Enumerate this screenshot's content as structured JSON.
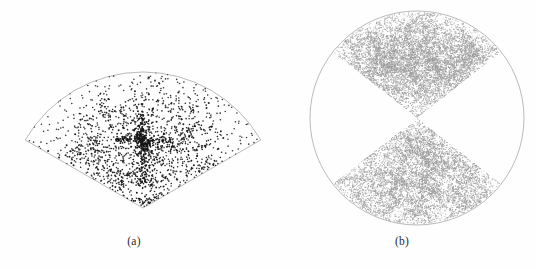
{
  "figure": {
    "background_color": "#fefefe",
    "width": 536,
    "height": 269
  },
  "panels": [
    {
      "id": "a",
      "caption": "(a)",
      "name": "wedge-slice-scatter"
    },
    {
      "id": "b",
      "caption": "(b)",
      "name": "circular-bowtie-scatter"
    }
  ],
  "chart_data": [
    {
      "type": "scatter",
      "panel": "a",
      "title": "(a)",
      "xlabel": "",
      "ylabel": "",
      "geometry": "annular-wedge",
      "grid": false,
      "legend": null,
      "point_color": "#161616",
      "outline_color": "#8d8d8d",
      "point_size_px": 1.6,
      "n_points": 1100,
      "apex": [
        143,
        208
      ],
      "radius": 136,
      "half_angle_deg": 60,
      "description": "Sparse wedge-shaped redshift survey slice with filamentary 'stick-man' structure radiating from the apex; dark discrete points on white.",
      "clusters": [
        {
          "cx": 143,
          "cy": 140,
          "spread": 7,
          "n": 150,
          "label": "central-core"
        },
        {
          "cx": 143,
          "cy": 122,
          "spread": 16,
          "n": 60,
          "label": "upper-spur"
        },
        {
          "cx": 143,
          "cy": 160,
          "spread": 14,
          "n": 55,
          "label": "lower-spur"
        },
        {
          "cx": 113,
          "cy": 141,
          "spread": 14,
          "n": 50,
          "label": "left-arm"
        },
        {
          "cx": 174,
          "cy": 141,
          "spread": 14,
          "n": 50,
          "label": "right-arm"
        },
        {
          "cx": 88,
          "cy": 146,
          "spread": 18,
          "n": 60,
          "label": "left-filament"
        },
        {
          "cx": 199,
          "cy": 133,
          "spread": 18,
          "n": 60,
          "label": "right-filament"
        },
        {
          "cx": 126,
          "cy": 179,
          "spread": 13,
          "n": 45,
          "label": "lower-left-leg"
        },
        {
          "cx": 160,
          "cy": 184,
          "spread": 13,
          "n": 45,
          "label": "lower-right-leg"
        },
        {
          "cx": 152,
          "cy": 201,
          "spread": 11,
          "n": 55,
          "label": "apex-band"
        },
        {
          "cx": 112,
          "cy": 112,
          "spread": 16,
          "n": 40,
          "label": "upper-left-knot"
        },
        {
          "cx": 180,
          "cy": 108,
          "spread": 16,
          "n": 40,
          "label": "upper-right-knot"
        },
        {
          "cx": 211,
          "cy": 165,
          "spread": 14,
          "n": 35,
          "label": "right-outer-knot"
        },
        {
          "cx": 72,
          "cy": 163,
          "spread": 13,
          "n": 30,
          "label": "left-outer-knot"
        }
      ]
    },
    {
      "type": "scatter",
      "panel": "b",
      "title": "(b)",
      "xlabel": "",
      "ylabel": "",
      "geometry": "circle-with-opposing-wedges",
      "grid": false,
      "legend": null,
      "point_color": "#9b9b9b",
      "outline_color": "#b0b0b0",
      "point_size_px": 1.1,
      "n_points": 6500,
      "center": [
        417,
        118
      ],
      "radius": 107,
      "wedge_half_angle_deg": 52,
      "description": "Full circular simulation volume with two opposing (bow-tie) wedges densely filled by light-gray points tracing a cosmic-web filament network; empty quadrants left and right.",
      "clusters": [
        {
          "cx": 417,
          "cy": 72,
          "spread": 26,
          "n": 600,
          "label": "upper-web-core"
        },
        {
          "cx": 417,
          "cy": 168,
          "spread": 26,
          "n": 600,
          "label": "lower-web-core"
        },
        {
          "cx": 380,
          "cy": 60,
          "spread": 20,
          "n": 260,
          "label": "upper-left-node"
        },
        {
          "cx": 455,
          "cy": 66,
          "spread": 20,
          "n": 260,
          "label": "upper-right-node"
        },
        {
          "cx": 378,
          "cy": 180,
          "spread": 20,
          "n": 260,
          "label": "lower-left-node"
        },
        {
          "cx": 457,
          "cy": 176,
          "spread": 20,
          "n": 260,
          "label": "lower-right-node"
        }
      ]
    }
  ]
}
